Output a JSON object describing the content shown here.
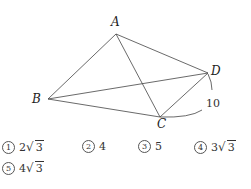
{
  "figure": {
    "points": {
      "A": {
        "label": "A",
        "x": 116,
        "y": 34
      },
      "B": {
        "label": "B",
        "x": 48,
        "y": 99
      },
      "C": {
        "label": "C",
        "x": 160,
        "y": 117
      },
      "D": {
        "label": "D",
        "x": 208,
        "y": 73
      }
    },
    "segments": [
      "AB",
      "AC",
      "AD",
      "BC",
      "BD",
      "CD"
    ],
    "length_label": "10"
  },
  "choices": [
    {
      "marker": "1",
      "coef": "2",
      "radicand": "3",
      "plain": ""
    },
    {
      "marker": "2",
      "coef": "",
      "radicand": "",
      "plain": "4"
    },
    {
      "marker": "3",
      "coef": "",
      "radicand": "",
      "plain": "5"
    },
    {
      "marker": "4",
      "coef": "3",
      "radicand": "3",
      "plain": ""
    },
    {
      "marker": "5",
      "coef": "4",
      "radicand": "3",
      "plain": ""
    }
  ]
}
